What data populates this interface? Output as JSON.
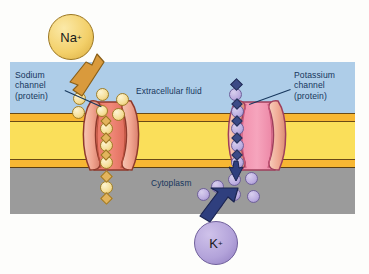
{
  "figure": {
    "type": "biology-diagram"
  },
  "regions": {
    "extracellular": {
      "label": "Extracellular fluid",
      "color": "#aecde8"
    },
    "membrane": {
      "outer_leaflet_color": "#f7b733",
      "core_color": "#fadf5a",
      "inner_leaflet_color": "#f7b733"
    },
    "cytoplasm": {
      "label": "Cytoplasm",
      "color": "#9b9b9b"
    }
  },
  "labels": {
    "sodium_channel": "Sodium\nchannel\n(protein)",
    "potassium_channel": "Potassium\nchannel\n(protein)"
  },
  "ions": {
    "sodium": {
      "symbol": "Na",
      "charge": "+",
      "color": "#f3d06a",
      "direction": "into cytoplasm",
      "count_visible": 12
    },
    "potassium": {
      "symbol": "K",
      "charge": "+",
      "color": "#b3a3da",
      "direction": "out of cytoplasm",
      "count_visible": 12
    }
  },
  "channels": {
    "sodium": {
      "name": "Sodium channel",
      "protein_color": "#f0a090"
    },
    "potassium": {
      "name": "Potassium channel",
      "protein_color": "#f09ab0"
    }
  }
}
